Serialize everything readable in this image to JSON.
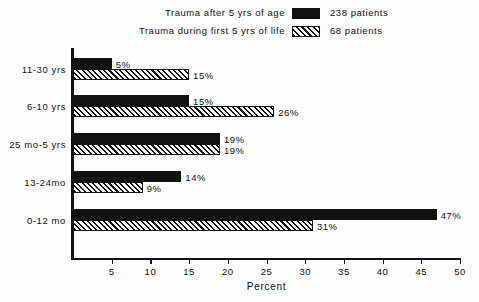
{
  "chart_data": {
    "type": "bar",
    "orientation": "horizontal",
    "title": "",
    "xlabel": "Percent",
    "ylabel": "",
    "xlim": [
      0,
      50
    ],
    "xticks": [
      5,
      10,
      15,
      20,
      25,
      30,
      35,
      40,
      45,
      50
    ],
    "grid": false,
    "legend_position": "top",
    "categories": [
      "11-30 yrs",
      "6-10 yrs",
      "25 mo-5 yrs",
      "13-24mo",
      "0-12 mo"
    ],
    "series": [
      {
        "name": "Trauma after 5 yrs of age",
        "count_label": "238 patients",
        "fill": "solid-black",
        "values": [
          5,
          15,
          19,
          14,
          47
        ],
        "value_labels": [
          "5%",
          "15%",
          "19%",
          "14%",
          "47%"
        ]
      },
      {
        "name": "Trauma during first 5 yrs of life",
        "count_label": "68 patients",
        "fill": "diagonal-hatch",
        "values": [
          15,
          26,
          19,
          9,
          31
        ],
        "value_labels": [
          "15%",
          "26%",
          "19%",
          "9%",
          "31%"
        ]
      }
    ]
  },
  "legend": {
    "rows": [
      {
        "label": "Trauma after 5 yrs of age",
        "count": "238 patients",
        "swatch": "solid-black-swatch"
      },
      {
        "label": "Trauma during first 5 yrs of life",
        "count": "68 patients",
        "swatch": "diagonal-hatch-swatch"
      }
    ]
  },
  "axis": {
    "x_title": "Percent",
    "x_tick_labels": [
      "5",
      "10",
      "15",
      "20",
      "25",
      "30",
      "35",
      "40",
      "45",
      "50"
    ],
    "y_tick_labels": [
      "11-30 yrs",
      "6-10 yrs",
      "25 mo-5 yrs",
      "13-24mo",
      "0-12 mo"
    ]
  },
  "colors": {
    "ink": "#111111",
    "background": "#fdfdfd",
    "series_solid": "#111111",
    "series_hatch_line": "#111111",
    "series_hatch_fill": "#ffffff"
  }
}
